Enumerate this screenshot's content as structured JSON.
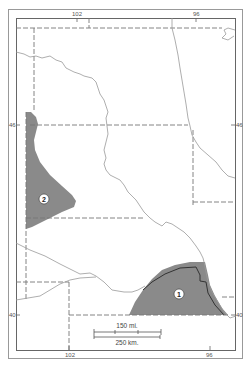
{
  "map": {
    "longitude_labels": {
      "top": [
        "102",
        "96"
      ],
      "bottom": [
        "102",
        "96"
      ]
    },
    "latitude_labels": {
      "left": [
        "46",
        "40"
      ],
      "right": [
        "46",
        "40"
      ]
    },
    "regions": [
      {
        "id": "1",
        "label": "1"
      },
      {
        "id": "2",
        "label": "2"
      }
    ],
    "scale_bar": {
      "miles_label": "150 mi.",
      "km_label": "250 km."
    },
    "colors": {
      "region_fill": "#8a8a8a",
      "frame": "#888888",
      "state_border": "#777777",
      "river": "#999999",
      "background": "#ffffff"
    }
  }
}
